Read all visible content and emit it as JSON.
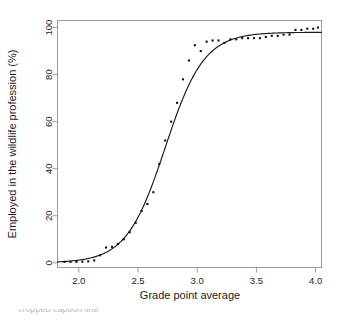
{
  "chart_data": {
    "type": "scatter",
    "title": "",
    "xlabel": "Grade point average",
    "ylabel": "Employed in the wildlife profession (%)",
    "xlim": [
      1.82,
      4.05
    ],
    "ylim": [
      -2,
      103
    ],
    "xticks": [
      "2.0",
      "2.5",
      "3.0",
      "3.5",
      "4.0"
    ],
    "xtick_values": [
      2.0,
      2.5,
      3.0,
      3.5,
      4.0
    ],
    "yticks": [
      "0",
      "20",
      "40",
      "60",
      "80",
      "100"
    ],
    "ytick_values": [
      0,
      20,
      40,
      60,
      80,
      100
    ],
    "grid": false,
    "legend": "none",
    "point_color": "#111111",
    "line_color": "#1a1a1a",
    "frame_color": "#9a9a9a",
    "background": "#ffffff",
    "series": [
      {
        "name": "Observed percentage employed",
        "marker": "square",
        "x": [
          1.88,
          1.93,
          1.98,
          2.03,
          2.08,
          2.13,
          2.18,
          2.23,
          2.28,
          2.33,
          2.38,
          2.43,
          2.48,
          2.53,
          2.58,
          2.63,
          2.68,
          2.73,
          2.78,
          2.83,
          2.88,
          2.93,
          2.98,
          3.03,
          3.08,
          3.13,
          3.18,
          3.23,
          3.28,
          3.33,
          3.38,
          3.43,
          3.48,
          3.53,
          3.58,
          3.63,
          3.68,
          3.73,
          3.78,
          3.83,
          3.88,
          3.93,
          3.98,
          4.02
        ],
        "y": [
          0.4,
          0.4,
          0.4,
          0.5,
          0.6,
          1.0,
          3.2,
          6.5,
          6.8,
          8.0,
          10.0,
          13.0,
          17.0,
          22.0,
          25.0,
          30.0,
          42.0,
          52.0,
          60.0,
          68.0,
          78.0,
          86.0,
          92.5,
          90.0,
          94.0,
          94.5,
          94.5,
          93.5,
          95.0,
          95.0,
          95.5,
          95.5,
          95.5,
          95.5,
          96.0,
          96.5,
          96.5,
          97.0,
          97.0,
          99.0,
          99.0,
          99.5,
          99.5,
          100.0
        ]
      },
      {
        "name": "Fitted logistic curve",
        "marker": "line",
        "midpoint": 2.73,
        "steepness": 6.1,
        "asymptote": 98.0,
        "x": [
          1.82,
          1.92,
          2.02,
          2.12,
          2.22,
          2.32,
          2.42,
          2.52,
          2.62,
          2.72,
          2.82,
          2.92,
          3.02,
          3.12,
          3.22,
          3.32,
          3.42,
          3.52,
          3.62,
          3.72,
          3.82,
          3.92,
          4.02
        ],
        "y": [
          0.4,
          0.7,
          1.2,
          2.2,
          3.9,
          6.8,
          11.7,
          19.4,
          30.6,
          45.0,
          60.2,
          73.4,
          83.2,
          89.6,
          93.4,
          95.5,
          96.7,
          97.3,
          97.6,
          97.8,
          97.9,
          98.0,
          98.0
        ]
      }
    ]
  },
  "caption": {
    "text": "cropped caption line"
  }
}
